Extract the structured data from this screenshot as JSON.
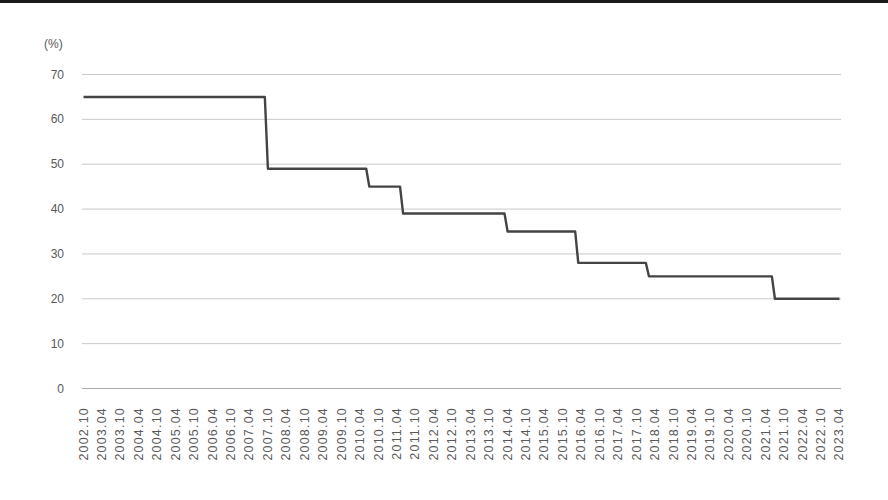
{
  "chart_data": {
    "type": "line",
    "line_style": "step",
    "title": "",
    "xlabel": "",
    "ylabel": "(%)",
    "ylim": [
      0,
      70
    ],
    "y_ticks": [
      0,
      10,
      20,
      30,
      40,
      50,
      60,
      70
    ],
    "grid": true,
    "legend_position": "none",
    "x_start": "2002.10",
    "x_end": "2023.04",
    "x_tick_interval_months": 6,
    "x_tick_labels": [
      "2002.10",
      "2003.04",
      "2003.10",
      "2004.04",
      "2004.10",
      "2005.04",
      "2005.10",
      "2006.04",
      "2006.10",
      "2007.04",
      "2007.10",
      "2008.04",
      "2008.10",
      "2009.04",
      "2009.10",
      "2010.04",
      "2010.10",
      "2011.04",
      "2011.10",
      "2012.04",
      "2012.10",
      "2013.04",
      "2013.10",
      "2014.04",
      "2014.10",
      "2015.04",
      "2015.10",
      "2016.04",
      "2016.10",
      "2017.04",
      "2017.10",
      "2018.04",
      "2018.10",
      "2019.04",
      "2019.10",
      "2020.04",
      "2020.10",
      "2021.04",
      "2021.10",
      "2022.04",
      "2022.10",
      "2023.04"
    ],
    "series": [
      {
        "name": "max-rate-percent",
        "color": "#444444",
        "steps": [
          {
            "from": "2002.10",
            "value": 65
          },
          {
            "from": "2007.10",
            "value": 49
          },
          {
            "from": "2010.07",
            "value": 45
          },
          {
            "from": "2011.06",
            "value": 39
          },
          {
            "from": "2014.04",
            "value": 35
          },
          {
            "from": "2016.03",
            "value": 28
          },
          {
            "from": "2018.02",
            "value": 25
          },
          {
            "from": "2021.07",
            "value": 20
          }
        ]
      }
    ]
  },
  "styles": {
    "background": "#ffffff",
    "text_color": "#595959",
    "grid_color": "#c9c9c9",
    "axis_color": "#ababab",
    "line_color": "#444444",
    "top_rule_color": "#1a1a1a"
  }
}
